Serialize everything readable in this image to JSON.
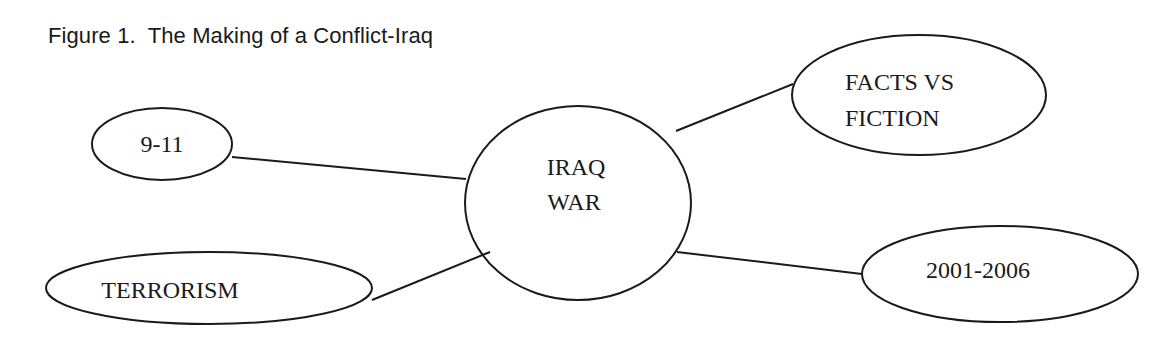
{
  "figure": {
    "title": "Figure 1.  The Making of a Conflict-Iraq"
  },
  "diagram": {
    "type": "mind-map",
    "center": {
      "label_line1": "IRAQ",
      "label_line2": "WAR"
    },
    "nodes": [
      {
        "id": "9-11",
        "label": "9-11"
      },
      {
        "id": "terrorism",
        "label": "TERRORISM"
      },
      {
        "id": "facts-vs-fiction",
        "label_line1": "FACTS VS",
        "label_line2": "FICTION"
      },
      {
        "id": "2001-2006",
        "label": "2001-2006"
      }
    ],
    "edges": [
      {
        "from": "9-11",
        "to": "iraq-war"
      },
      {
        "from": "terrorism",
        "to": "iraq-war"
      },
      {
        "from": "iraq-war",
        "to": "facts-vs-fiction"
      },
      {
        "from": "iraq-war",
        "to": "2001-2006"
      }
    ],
    "stroke_color": "#1a1a1a",
    "background": "#ffffff"
  }
}
